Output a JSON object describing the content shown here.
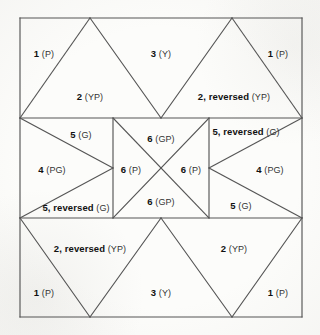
{
  "figure": {
    "name": "quilt-block-piecing-diagram",
    "background_color": "#fcfcfa",
    "line_color": "#555555",
    "text_color": "#1d1d1d",
    "border": {
      "x": 20,
      "y": 18,
      "width": 282,
      "height": 299
    },
    "band_lines_y": [
      118,
      218
    ],
    "center_square": {
      "left": 113,
      "right": 209,
      "top": 118,
      "bottom": 218
    },
    "top_apexes_x": [
      90,
      232
    ],
    "bottom_apexes_x": [
      90,
      232
    ],
    "band_v_vertex_x": 161
  },
  "labels": {
    "top_band": [
      {
        "id": "top-left-corner",
        "num": "1",
        "code": "(P)",
        "x": 44,
        "y": 52
      },
      {
        "id": "top-left-triangle",
        "num": "2",
        "code": "(YP)",
        "x": 90,
        "y": 95
      },
      {
        "id": "top-middle",
        "num": "3",
        "code": "(Y)",
        "x": 161,
        "y": 52
      },
      {
        "id": "top-right-triangle",
        "num": "2, reversed",
        "code": "(YP)",
        "x": 234,
        "y": 95
      },
      {
        "id": "top-right-corner",
        "num": "1",
        "code": "(P)",
        "x": 278,
        "y": 52
      }
    ],
    "middle_band": [
      {
        "id": "mid-left-upper",
        "num": "5",
        "code": "(G)",
        "x": 81,
        "y": 133
      },
      {
        "id": "mid-left-point",
        "num": "4",
        "code": "(PG)",
        "x": 52,
        "y": 168
      },
      {
        "id": "mid-left-lower",
        "num": "5, reversed",
        "code": "(G)",
        "x": 76,
        "y": 206
      },
      {
        "id": "center-top",
        "num": "6",
        "code": "(GP)",
        "x": 161,
        "y": 137
      },
      {
        "id": "center-left",
        "num": "6",
        "code": "(P)",
        "x": 131,
        "y": 168
      },
      {
        "id": "center-right",
        "num": "6",
        "code": "(P)",
        "x": 191,
        "y": 168
      },
      {
        "id": "center-bottom",
        "num": "6",
        "code": "(GP)",
        "x": 161,
        "y": 200
      },
      {
        "id": "mid-right-upper",
        "num": "5, reversed",
        "code": "(G)",
        "x": 246,
        "y": 130
      },
      {
        "id": "mid-right-point",
        "num": "4",
        "code": "(PG)",
        "x": 270,
        "y": 168
      },
      {
        "id": "mid-right-lower",
        "num": "5",
        "code": "(G)",
        "x": 241,
        "y": 204
      }
    ],
    "bottom_band": [
      {
        "id": "bottom-left-triangle",
        "num": "2, reversed",
        "code": "(YP)",
        "x": 90,
        "y": 247
      },
      {
        "id": "bottom-right-triangle",
        "num": "2",
        "code": "(YP)",
        "x": 234,
        "y": 247
      },
      {
        "id": "bottom-left-corner",
        "num": "1",
        "code": "(P)",
        "x": 44,
        "y": 291
      },
      {
        "id": "bottom-middle",
        "num": "3",
        "code": "(Y)",
        "x": 161,
        "y": 291
      },
      {
        "id": "bottom-right-corner",
        "num": "1",
        "code": "(P)",
        "x": 278,
        "y": 291
      }
    ]
  }
}
